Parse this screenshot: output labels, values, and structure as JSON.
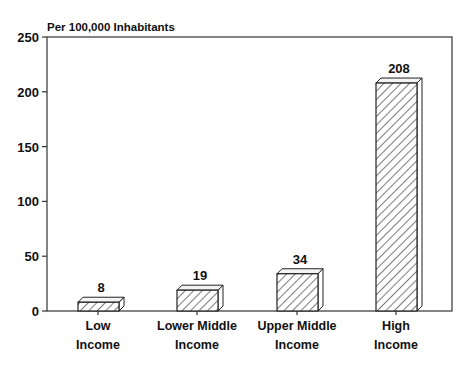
{
  "chart_data": {
    "type": "bar",
    "title": "",
    "subtitle": "Per 100,000 Inhabitants",
    "xlabel": "",
    "ylabel": "Per 100,000 Inhabitants",
    "categories": [
      [
        "Low",
        "Income"
      ],
      [
        "Lower Middle",
        "Income"
      ],
      [
        "Upper Middle",
        "Income"
      ],
      [
        "High",
        "Income"
      ]
    ],
    "category_names": [
      "Low Income",
      "Lower Middle Income",
      "Upper Middle Income",
      "High Income"
    ],
    "values": [
      8,
      19,
      34,
      208
    ],
    "data_labels": [
      "8",
      "19",
      "34",
      "208"
    ],
    "ylim": [
      0,
      250
    ],
    "yticks": [
      0,
      50,
      100,
      150,
      200,
      250
    ],
    "ytick_labels": [
      "0",
      "50",
      "100",
      "150",
      "200",
      "250"
    ],
    "grid": false,
    "legend": null,
    "style": {
      "bar_fill": "diagonal-hatch",
      "bar_3d": true,
      "frame": true
    }
  },
  "colors": {
    "ink": "#111111",
    "background": "#ffffff",
    "bar_top": "#f4f4f4",
    "bar_side": "#ffffff"
  }
}
